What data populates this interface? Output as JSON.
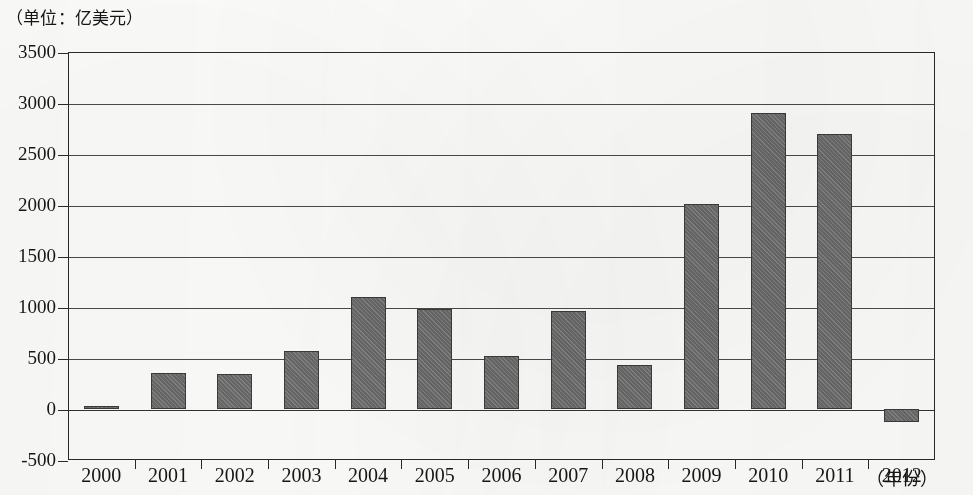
{
  "caption": {
    "unit_label": "（单位：亿美元）"
  },
  "axis": {
    "x_title": "（年份）",
    "y_ticks": [
      "3500",
      "3000",
      "2500",
      "2000",
      "1500",
      "1000",
      "500",
      "0",
      "-500"
    ]
  },
  "chart_data": {
    "type": "bar",
    "title": "",
    "subtitle": "",
    "xlabel": "（年份）",
    "ylabel": "（单位：亿美元）",
    "unit": "亿美元",
    "categories": [
      "2000",
      "2001",
      "2002",
      "2003",
      "2004",
      "2005",
      "2006",
      "2007",
      "2008",
      "2009",
      "2010",
      "2011",
      "2012"
    ],
    "values": [
      30,
      355,
      340,
      570,
      1100,
      980,
      520,
      960,
      430,
      2010,
      2900,
      2700,
      -130
    ],
    "ylim": [
      -500,
      3500
    ],
    "ytick_step": 500,
    "yticks": [
      -500,
      0,
      500,
      1000,
      1500,
      2000,
      2500,
      3000,
      3500
    ],
    "grid": true,
    "grid_axis": "y",
    "legend": "none",
    "bar_color": "#6e6e6e",
    "bar_edge_color": "#3b3b3b",
    "frame_color": "#2a2a2a"
  }
}
